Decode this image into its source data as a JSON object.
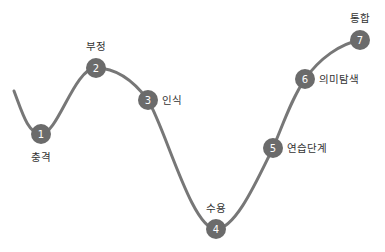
{
  "diagram": {
    "title": "",
    "colors": {
      "node": "#6b6b6b",
      "line": "#777777",
      "number": "#ffffff",
      "label": "#333333"
    },
    "stages": [
      {
        "number": "1",
        "label": "충격",
        "label_position": "below"
      },
      {
        "number": "2",
        "label": "부정",
        "label_position": "above"
      },
      {
        "number": "3",
        "label": "인식",
        "label_position": "right"
      },
      {
        "number": "4",
        "label": "수용",
        "label_position": "above"
      },
      {
        "number": "5",
        "label": "연습단계",
        "label_position": "right"
      },
      {
        "number": "6",
        "label": "의미탐색",
        "label_position": "right"
      },
      {
        "number": "7",
        "label": "통합",
        "label_position": "above"
      }
    ]
  }
}
